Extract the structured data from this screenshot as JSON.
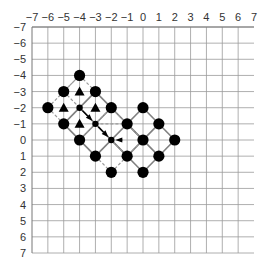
{
  "chart_data": {
    "type": "scatter",
    "title": "",
    "xlabel": "",
    "ylabel": "",
    "xlim": [
      -7,
      7
    ],
    "ylim": [
      -7,
      7
    ],
    "y_axis_inverted": true,
    "grid": true,
    "x_ticks": [
      "-7",
      "-6",
      "-5",
      "-4",
      "-3",
      "-2",
      "-1",
      "0",
      "1",
      "2",
      "3",
      "4",
      "5",
      "6",
      "7"
    ],
    "y_ticks": [
      "-7",
      "-6",
      "-5",
      "-4",
      "-3",
      "-2",
      "-1",
      "0",
      "1",
      "2",
      "3",
      "4",
      "5",
      "6",
      "7"
    ],
    "series": [
      {
        "name": "large-circles",
        "marker": "circle",
        "points": [
          [
            -4,
            -4
          ],
          [
            -5,
            -3
          ],
          [
            -3,
            -3
          ],
          [
            -6,
            -2
          ],
          [
            -2,
            -2
          ],
          [
            0,
            -2
          ],
          [
            -5,
            -1
          ],
          [
            -1,
            -1
          ],
          [
            1,
            -1
          ],
          [
            -4,
            0
          ],
          [
            0,
            0
          ],
          [
            2,
            0
          ],
          [
            -3,
            1
          ],
          [
            -1,
            1
          ],
          [
            1,
            1
          ],
          [
            -2,
            2
          ],
          [
            0,
            2
          ]
        ]
      },
      {
        "name": "small-dots",
        "marker": "small-circle",
        "points": [
          [
            -4,
            -2
          ],
          [
            -3,
            -1
          ],
          [
            -2,
            0
          ]
        ]
      },
      {
        "name": "triangles",
        "marker": "triangle",
        "points": [
          [
            -4,
            -3
          ],
          [
            -5,
            -2
          ],
          [
            -3,
            -2
          ],
          [
            -4,
            -1
          ]
        ]
      }
    ],
    "solid_segments": [
      [
        [
          -3,
          -3
        ],
        [
          0,
          0
        ]
      ],
      [
        [
          -4,
          -2
        ],
        [
          -1,
          1
        ]
      ],
      [
        [
          -5,
          -1
        ],
        [
          -3,
          1
        ]
      ],
      [
        [
          0,
          -2
        ],
        [
          2,
          0
        ]
      ],
      [
        [
          -2,
          0
        ],
        [
          0,
          2
        ]
      ],
      [
        [
          -1,
          -1
        ],
        [
          1,
          1
        ]
      ],
      [
        [
          -5,
          -1
        ],
        [
          -3,
          -3
        ]
      ],
      [
        [
          -4,
          0
        ],
        [
          -2,
          -2
        ]
      ],
      [
        [
          -3,
          1
        ],
        [
          0,
          -2
        ]
      ],
      [
        [
          -1,
          1
        ],
        [
          1,
          -1
        ]
      ],
      [
        [
          0,
          2
        ],
        [
          2,
          0
        ]
      ]
    ],
    "dashed_segments": [
      [
        [
          -6,
          -2
        ],
        [
          -4,
          -4
        ]
      ],
      [
        [
          -4,
          -4
        ],
        [
          -3,
          -3
        ]
      ],
      [
        [
          -6,
          -2
        ],
        [
          -5,
          -1
        ]
      ],
      [
        [
          -5,
          -3
        ],
        [
          -1,
          1
        ]
      ],
      [
        [
          -3,
          -1
        ],
        [
          -1,
          -1
        ]
      ],
      [
        [
          -2,
          -2
        ],
        [
          0,
          0
        ]
      ],
      [
        [
          -3,
          1
        ],
        [
          -2,
          2
        ]
      ],
      [
        [
          -2,
          2
        ],
        [
          0,
          0
        ]
      ],
      [
        [
          -5,
          -3
        ],
        [
          -4,
          -4
        ]
      ],
      [
        [
          -4,
          0
        ],
        [
          -2,
          -2
        ]
      ]
    ],
    "arrows": [
      {
        "from": [
          -4,
          -2
        ],
        "to": [
          -3,
          -1
        ]
      },
      {
        "from": [
          -3,
          -1
        ],
        "to": [
          -2,
          0
        ]
      },
      {
        "from": [
          -1.2,
          0
        ],
        "to": [
          -2,
          0
        ]
      }
    ]
  },
  "colors": {
    "grid": "#9a9a9a",
    "axis_frame": "#777777",
    "marker": "#000000",
    "solid_line": "#808080",
    "dashed_line": "#9a9a9a",
    "label": "#333333"
  }
}
